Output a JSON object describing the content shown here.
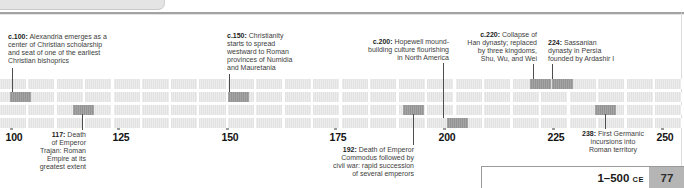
{
  "timeline": {
    "era": "CE",
    "row_count": 4,
    "ticks": [
      {
        "label": "100",
        "x": 14
      },
      {
        "label": "125",
        "x": 121
      },
      {
        "label": "150",
        "x": 230
      },
      {
        "label": "175",
        "x": 338
      },
      {
        "label": "200",
        "x": 447
      },
      {
        "label": "225",
        "x": 556
      },
      {
        "label": "250",
        "x": 665
      }
    ],
    "events": [
      {
        "id": "c100-alexandria",
        "year_label": "c.100:",
        "lines": [
          "Alexandria emerges as a",
          "center of Christian scholarship",
          "and seat of one of the earliest",
          "Christian bishoprics"
        ],
        "side": "above",
        "align": "left",
        "row": 2,
        "cell_x": 10,
        "leader_x": 12,
        "leader_y1": 68,
        "leader_y2": 92,
        "text_x": 8,
        "text_y": 33
      },
      {
        "id": "117-trajan",
        "year_label": "117:",
        "lines": [
          "Death",
          "of Emperor",
          "Trajan: Roman",
          "Empire at its",
          "greatest extent"
        ],
        "side": "below",
        "align": "right",
        "row": 3,
        "cell_x": 73,
        "leader_x": 82,
        "leader_y1": 114,
        "leader_y2": 130,
        "text_x": 86,
        "text_y": 131
      },
      {
        "id": "c150-christianity",
        "year_label": "c.150:",
        "lines": [
          "Christianity",
          "starts to spread",
          "westward to Roman",
          "provinces of Numidia",
          "and Mauretania"
        ],
        "side": "above",
        "align": "left",
        "row": 2,
        "cell_x": 228,
        "leader_x": 229,
        "leader_y1": 74,
        "leader_y2": 92,
        "text_x": 227,
        "text_y": 32
      },
      {
        "id": "192-commodus",
        "year_label": "192:",
        "lines": [
          "Death of Emperor",
          "Commodus followed by",
          "civil war: rapid succession",
          "of several emperors"
        ],
        "side": "below",
        "align": "right",
        "row": 3,
        "cell_x": 403,
        "leader_x": 413,
        "leader_y1": 114,
        "leader_y2": 145,
        "text_x": 414,
        "text_y": 146
      },
      {
        "id": "c200-hopewell",
        "year_label": "c.200:",
        "lines": [
          "Hopewell mound-",
          "building culture flourishing",
          "in North America"
        ],
        "side": "above",
        "align": "right",
        "row": 4,
        "cell_x": 447,
        "leader_x": 443,
        "leader_y1": 63,
        "leader_y2": 118,
        "text_x": 449,
        "text_y": 38
      },
      {
        "id": "c220-han-collapse",
        "year_label": "c.220:",
        "lines": [
          "Collapse of",
          "Han dynasty; replaced",
          "by three kingdoms,",
          "Shu, Wu, and Wei"
        ],
        "side": "above",
        "align": "right",
        "row": 1,
        "cell_x": 530,
        "leader_x": 533,
        "leader_y1": 64,
        "leader_y2": 79,
        "text_x": 537,
        "text_y": 31
      },
      {
        "id": "224-sassanian",
        "year_label": "224:",
        "lines": [
          "Sassanian",
          "dynasty in Persia",
          "founded by Ardashir I"
        ],
        "side": "above",
        "align": "left",
        "row": 1,
        "cell_x": 552,
        "leader_x": 552,
        "leader_y1": 64,
        "leader_y2": 79,
        "text_x": 548,
        "text_y": 39
      },
      {
        "id": "238-germanic",
        "year_label": "238:",
        "lines": [
          "First Germanic",
          "incursions into",
          "Roman territory"
        ],
        "side": "below",
        "align": "center",
        "row": 3,
        "cell_x": 595,
        "leader_x": 605,
        "leader_y1": 114,
        "leader_y2": 129,
        "text_x": 613,
        "text_y": 130
      }
    ]
  },
  "footer": {
    "period_label": "1–500",
    "era_label": "CE",
    "page_number": "77"
  }
}
